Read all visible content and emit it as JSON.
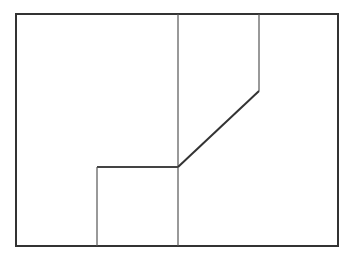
{
  "diagram": {
    "width": 348,
    "height": 260,
    "background": "#ffffff",
    "frame": {
      "x": 16,
      "y": 14,
      "width": 322,
      "height": 232,
      "stroke": "#333333",
      "stroke_width": 2
    },
    "lines": [
      {
        "id": "center-vertical",
        "points": "178,14 178,246",
        "stroke": "#555555",
        "stroke_width": 1.2
      },
      {
        "id": "upper-right-vertical",
        "points": "259,14 259,91",
        "stroke": "#555555",
        "stroke_width": 1.2
      },
      {
        "id": "diagonal",
        "points": "259,91 178,167",
        "stroke": "#333333",
        "stroke_width": 2
      },
      {
        "id": "mid-horizontal",
        "points": "178,167 97,167",
        "stroke": "#444444",
        "stroke_width": 1.8
      },
      {
        "id": "lower-left-vertical",
        "points": "97,167 97,246",
        "stroke": "#555555",
        "stroke_width": 1.2
      }
    ]
  }
}
